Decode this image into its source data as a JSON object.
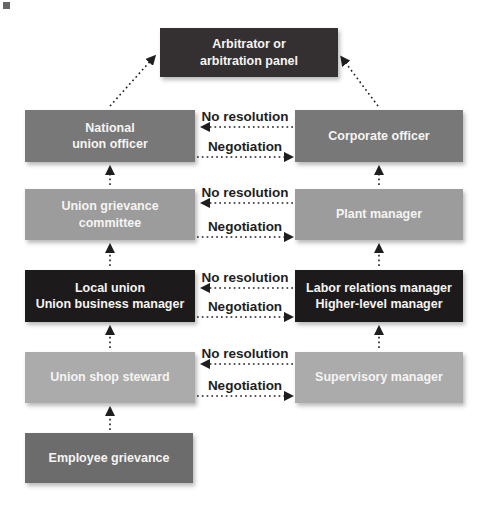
{
  "boxes": {
    "arbitrator": "Arbitrator or\narbitration panel",
    "national_union_officer": "National\nunion officer",
    "corporate_officer": "Corporate officer",
    "union_grievance_committee": "Union grievance\ncommittee",
    "plant_manager": "Plant manager",
    "local_union": "Local union\nUnion business manager",
    "labor_relations_manager": "Labor relations manager\nHigher-level manager",
    "union_shop_steward": "Union shop steward",
    "supervisory_manager": "Supervisory manager",
    "employee_grievance": "Employee grievance"
  },
  "connectors": {
    "rows": [
      {
        "no_resolution": "No resolution",
        "negotiation": "Negotiation"
      },
      {
        "no_resolution": "No resolution",
        "negotiation": "Negotiation"
      },
      {
        "no_resolution": "No resolution",
        "negotiation": "Negotiation"
      },
      {
        "no_resolution": "No resolution",
        "negotiation": "Negotiation"
      }
    ]
  },
  "colors": {
    "arbitrator_box": "#343031",
    "officer_level_boxes": "#787878",
    "committee_level_boxes": "#9c9c9c",
    "local_union_level_boxes": "#1d1a1b",
    "steward_level_boxes": "#ababab",
    "grievance_box": "#6c6c6c",
    "box_text": "#f5f4f2",
    "arrow_and_label": "#1e1e1e",
    "background": "#ffffff"
  }
}
